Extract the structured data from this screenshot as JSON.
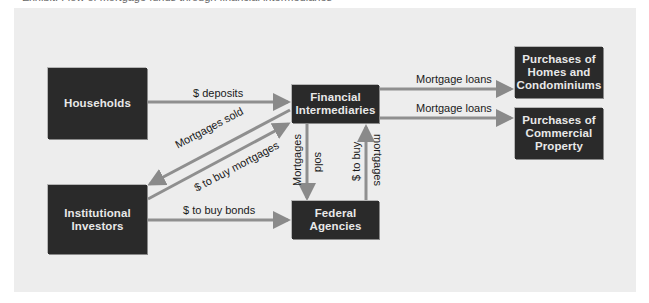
{
  "caption": "Exhibit: Flow of mortgage funds through financial intermediaries",
  "nodes": {
    "households": {
      "label": "Households"
    },
    "financial_intermediaries": {
      "line1": "Financial",
      "line2": "Intermediaries"
    },
    "institutional_investors": {
      "line1": "Institutional",
      "line2": "Investors"
    },
    "federal_agencies": {
      "line1": "Federal",
      "line2": "Agencies"
    },
    "homes": {
      "line1": "Purchases of",
      "line2": "Homes and",
      "line3": "Condominiums"
    },
    "commercial": {
      "line1": "Purchases of",
      "line2": "Commercial",
      "line3": "Property"
    }
  },
  "edges": {
    "deposits": "$ deposits",
    "mortgage_loans_homes": "Mortgage loans",
    "mortgage_loans_commercial": "Mortgage loans",
    "mortgages_sold_to_investors": "Mortgages sold",
    "dollars_buy_mortgages_investors": "$ to buy mortgages",
    "dollars_buy_bonds": "$ to buy bonds",
    "mortgages_sold_agencies_1": "Mortgages",
    "mortgages_sold_agencies_2": "sold",
    "dollars_buy_mortgages_agencies_1": "$ to buy",
    "dollars_buy_mortgages_agencies_2": "mortgages"
  },
  "colors": {
    "box": "#2a2a2a",
    "arrow": "#8a8a8a",
    "panel": "#ededed"
  }
}
